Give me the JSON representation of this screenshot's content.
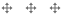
{
  "handles": {
    "items": [
      {
        "icon": "move-icon",
        "label": "Drag handle 1"
      },
      {
        "icon": "move-icon",
        "label": "Drag handle 2"
      },
      {
        "icon": "move-icon",
        "label": "Drag handle 3"
      }
    ],
    "color": "#6b6b6b"
  }
}
